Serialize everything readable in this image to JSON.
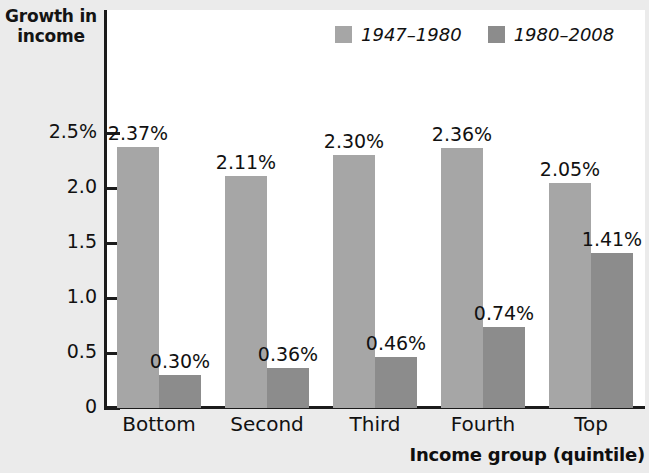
{
  "chart_data": {
    "type": "bar",
    "title": "",
    "ylabel": "Growth in income",
    "ylabel_line1": "Growth in",
    "ylabel_line2": "income",
    "xlabel": "Income group (quintile)",
    "categories": [
      "Bottom",
      "Second",
      "Third",
      "Fourth",
      "Top"
    ],
    "series": [
      {
        "name": "1947–1980",
        "color": "#a6a6a6",
        "values": [
          2.37,
          2.11,
          2.3,
          2.36,
          2.05
        ],
        "labels": [
          "2.37%",
          "2.11%",
          "2.30%",
          "2.36%",
          "2.05%"
        ]
      },
      {
        "name": "1980–2008",
        "color": "#8c8c8c",
        "values": [
          0.3,
          0.36,
          0.46,
          0.74,
          1.41
        ],
        "labels": [
          "0.30%",
          "0.36%",
          "0.46%",
          "0.74%",
          "1.41%"
        ]
      }
    ],
    "ylim": [
      0,
      2.9
    ],
    "yticks": [
      0,
      0.5,
      1.0,
      1.5,
      2.0,
      2.5
    ],
    "ytick_labels": [
      "0",
      "0.5",
      "1.0",
      "1.5",
      "2.0",
      "2.5%"
    ],
    "grid": false,
    "legend_position": "top-center",
    "plot_background": "#ffffff",
    "figure_background": "#ebebeb",
    "axis_color": "#1b1b1b"
  },
  "axis": {
    "y_title_line1": "Growth in",
    "y_title_line2": "income",
    "x_title": "Income group (quintile)",
    "y_labels": [
      "2.5%",
      "2.0",
      "1.5",
      "1.0",
      "0.5",
      "0"
    ],
    "x_labels": [
      "Bottom",
      "Second",
      "Third",
      "Fourth",
      "Top"
    ]
  },
  "legend": {
    "items": [
      {
        "label": "1947–1980",
        "color": "#a6a6a6"
      },
      {
        "label": "1980–2008",
        "color": "#8c8c8c"
      }
    ]
  },
  "bar_labels": {
    "series1": [
      "2.37%",
      "2.11%",
      "2.30%",
      "2.36%",
      "2.05%"
    ],
    "series2": [
      "0.30%",
      "0.36%",
      "0.46%",
      "0.74%",
      "1.41%"
    ]
  }
}
